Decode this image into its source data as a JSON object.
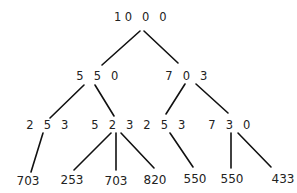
{
  "diagram": {
    "type": "tree",
    "root": {
      "id": "n0",
      "label": "10 0 0"
    },
    "nodes": [
      {
        "id": "n0",
        "label": "10 0 0",
        "level": 0
      },
      {
        "id": "n1",
        "label": "5 5 0",
        "level": 1,
        "parent": "n0"
      },
      {
        "id": "n2",
        "label": "7 0 3",
        "level": 1,
        "parent": "n0"
      },
      {
        "id": "n3",
        "label": "2 5 3",
        "level": 2,
        "parent": "n1"
      },
      {
        "id": "n4",
        "label": "5 2 3",
        "level": 2,
        "parent": "n1"
      },
      {
        "id": "n5",
        "label": "2 5 3",
        "level": 2,
        "parent": "n2"
      },
      {
        "id": "n6",
        "label": "7 3 0",
        "level": 2,
        "parent": "n2"
      },
      {
        "id": "n7",
        "label": "703",
        "level": 3,
        "parent": "n3"
      },
      {
        "id": "n8",
        "label": "253",
        "level": 3,
        "parent": "n4"
      },
      {
        "id": "n9",
        "label": "703",
        "level": 3,
        "parent": "n4"
      },
      {
        "id": "n10",
        "label": "820",
        "level": 3,
        "parent": "n4"
      },
      {
        "id": "n11",
        "label": "550",
        "level": 3,
        "parent": "n5"
      },
      {
        "id": "n12",
        "label": "550",
        "level": 3,
        "parent": "n6"
      },
      {
        "id": "n13",
        "label": "433",
        "level": 3,
        "parent": "n6"
      }
    ],
    "edges": [
      [
        "n0",
        "n1"
      ],
      [
        "n0",
        "n2"
      ],
      [
        "n1",
        "n3"
      ],
      [
        "n1",
        "n4"
      ],
      [
        "n2",
        "n5"
      ],
      [
        "n2",
        "n6"
      ],
      [
        "n3",
        "n7"
      ],
      [
        "n4",
        "n8"
      ],
      [
        "n4",
        "n9"
      ],
      [
        "n4",
        "n10"
      ],
      [
        "n5",
        "n11"
      ],
      [
        "n6",
        "n12"
      ],
      [
        "n6",
        "n13"
      ]
    ]
  }
}
